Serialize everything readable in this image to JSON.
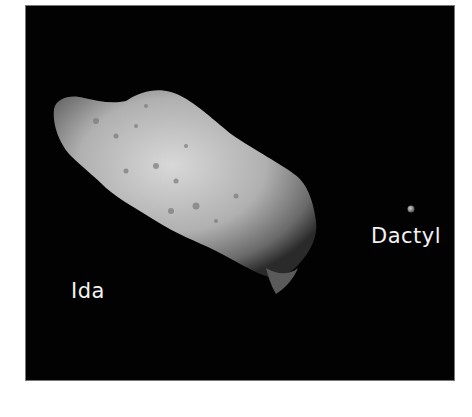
{
  "figure": {
    "background_color": "#020202",
    "labels": {
      "primary": "Ida",
      "moon": "Dactyl"
    }
  }
}
